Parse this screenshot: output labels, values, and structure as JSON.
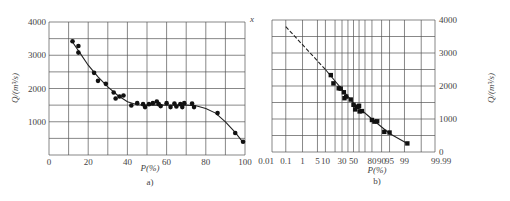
{
  "chart_data": [
    {
      "panel": "a)",
      "type": "scatter",
      "title": "",
      "xlabel": "P(%)",
      "ylabel": "Q/(m³/s)",
      "xlim": [
        0,
        100
      ],
      "ylim": [
        0,
        4000
      ],
      "xticks": [
        0,
        20,
        40,
        60,
        80,
        100
      ],
      "yticks": [
        1000,
        2000,
        3000,
        4000
      ],
      "grid": true,
      "corner_mark": "x",
      "points": [
        [
          12,
          3420
        ],
        [
          15,
          3280
        ],
        [
          15,
          3080
        ],
        [
          23,
          2470
        ],
        [
          25,
          2230
        ],
        [
          29,
          2140
        ],
        [
          33,
          1880
        ],
        [
          34,
          1700
        ],
        [
          36,
          1760
        ],
        [
          38,
          1790
        ],
        [
          42,
          1490
        ],
        [
          45,
          1560
        ],
        [
          48,
          1530
        ],
        [
          49,
          1440
        ],
        [
          51,
          1530
        ],
        [
          53,
          1560
        ],
        [
          55,
          1610
        ],
        [
          56,
          1530
        ],
        [
          57,
          1470
        ],
        [
          60,
          1560
        ],
        [
          62,
          1440
        ],
        [
          64,
          1550
        ],
        [
          65,
          1460
        ],
        [
          67,
          1530
        ],
        [
          68,
          1440
        ],
        [
          69,
          1560
        ],
        [
          73,
          1550
        ],
        [
          74,
          1440
        ],
        [
          86,
          1260
        ],
        [
          95,
          660
        ],
        [
          99,
          400
        ]
      ],
      "fit_curve": [
        [
          12,
          3400
        ],
        [
          16,
          3050
        ],
        [
          20,
          2700
        ],
        [
          25,
          2350
        ],
        [
          30,
          2050
        ],
        [
          35,
          1800
        ],
        [
          40,
          1600
        ],
        [
          45,
          1510
        ],
        [
          50,
          1500
        ],
        [
          60,
          1500
        ],
        [
          70,
          1500
        ],
        [
          75,
          1480
        ],
        [
          80,
          1400
        ],
        [
          85,
          1260
        ],
        [
          90,
          1000
        ],
        [
          95,
          680
        ],
        [
          99,
          380
        ]
      ]
    },
    {
      "panel": "b)",
      "type": "scatter",
      "title": "",
      "xlabel": "P(%)",
      "ylabel": "Q/(m³/s)",
      "x_scale": "probability",
      "xlim": [
        0.01,
        99.99
      ],
      "ylim": [
        0,
        4000
      ],
      "xticks": [
        "0.01",
        "0.1",
        "1",
        "5",
        "10",
        "30",
        "50",
        "80",
        "90",
        "95",
        "99",
        "99.99"
      ],
      "yticks": [
        0,
        1000,
        2000,
        3000,
        4000
      ],
      "y_axis_position": "right",
      "grid": true,
      "points": [
        [
          15,
          2330
        ],
        [
          18,
          2080
        ],
        [
          25,
          1930
        ],
        [
          28,
          1920
        ],
        [
          33,
          1810
        ],
        [
          34,
          1630
        ],
        [
          37,
          1680
        ],
        [
          45,
          1590
        ],
        [
          50,
          1430
        ],
        [
          53,
          1290
        ],
        [
          56,
          1370
        ],
        [
          60,
          1400
        ],
        [
          61,
          1230
        ],
        [
          65,
          1240
        ],
        [
          80,
          970
        ],
        [
          83,
          920
        ],
        [
          86,
          930
        ],
        [
          92,
          610
        ],
        [
          95,
          590
        ],
        [
          99.3,
          260
        ]
      ],
      "fit_curve_dashed": [
        [
          0.1,
          3800
        ],
        [
          10,
          2500
        ]
      ],
      "fit_curve_solid": [
        [
          10,
          2500
        ],
        [
          50,
          1480
        ],
        [
          80,
          1000
        ],
        [
          95,
          560
        ],
        [
          99.3,
          260
        ]
      ]
    }
  ],
  "panel_a": {
    "ylabel": "Q/(m³/s)",
    "xlabel": "P(%)",
    "caption": "a)",
    "corner_mark": "x",
    "yticks": [
      "4000",
      "3000",
      "2000",
      "1000"
    ],
    "xticks": [
      "0",
      "20",
      "40",
      "60",
      "80",
      "100"
    ]
  },
  "panel_b": {
    "ylabel": "Q/(m³/s)",
    "xlabel": "P(%)",
    "caption": "b)",
    "yticks": [
      "4000",
      "3000",
      "2000",
      "1000",
      "0"
    ],
    "xticks": [
      "0.01",
      "0.1",
      "1",
      "5 10",
      "30 50",
      "80 90 95",
      "99",
      "99.99"
    ]
  }
}
